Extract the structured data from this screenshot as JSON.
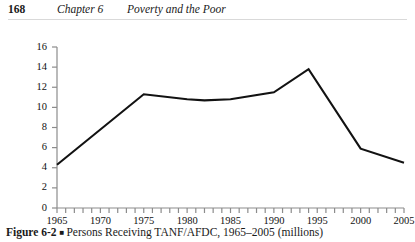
{
  "running_head": {
    "folio": "168",
    "chapter": "Chapter 6",
    "title": "Poverty and the Poor"
  },
  "caption": {
    "label": "Figure 6-2",
    "bullet": "■",
    "text": "Persons Receiving TANF/AFDC, 1965–2005 (millions)"
  },
  "chart_data": {
    "type": "line",
    "title": "Persons Receiving TANF/AFDC, 1965–2005 (millions)",
    "xlabel": "",
    "ylabel": "",
    "xlim": [
      1965,
      2005
    ],
    "ylim": [
      0,
      16
    ],
    "ytick_step": 2,
    "xtick_step": 1,
    "grid": false,
    "legend": "none",
    "line_color": "#121212",
    "axis_color": "#8c8c8c",
    "y_ticks": [
      "0",
      "2",
      "4",
      "6",
      "8",
      "10",
      "12",
      "14",
      "16"
    ],
    "x_ticks": [
      "1965",
      "1970",
      "1975",
      "1980",
      "1985",
      "1990",
      "1995",
      "2000",
      "2005"
    ],
    "x_tick_years": [
      1965,
      1970,
      1975,
      1980,
      1985,
      1990,
      1995,
      2000,
      2005
    ],
    "x": [
      1965,
      1975,
      1980,
      1982,
      1985,
      1990,
      1994,
      2000,
      2005
    ],
    "values": [
      4.3,
      11.3,
      10.8,
      10.7,
      10.8,
      11.5,
      13.8,
      5.9,
      4.5
    ],
    "series": [
      {
        "name": "Persons Receiving TANF/AFDC (millions)",
        "points": [
          {
            "x": 1965,
            "y": 4.3
          },
          {
            "x": 1975,
            "y": 11.3
          },
          {
            "x": 1980,
            "y": 10.8
          },
          {
            "x": 1982,
            "y": 10.7
          },
          {
            "x": 1985,
            "y": 10.8
          },
          {
            "x": 1990,
            "y": 11.5
          },
          {
            "x": 1994,
            "y": 13.8
          },
          {
            "x": 2000,
            "y": 5.9
          },
          {
            "x": 2005,
            "y": 4.5
          }
        ]
      }
    ]
  }
}
